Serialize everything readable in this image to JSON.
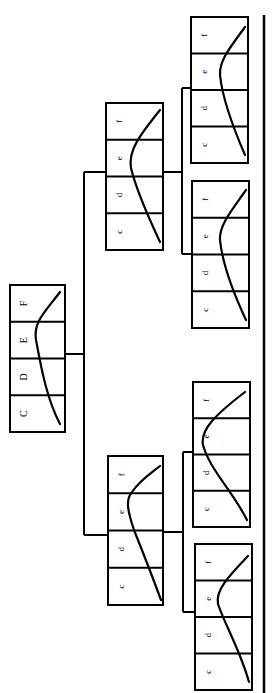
{
  "diagram": {
    "orientation": "rotated-90-ccw",
    "root": {
      "labels": [
        "C",
        "D",
        "E",
        "F"
      ],
      "box": {
        "x": 10,
        "y": 285,
        "w": 55,
        "h": 147
      },
      "curve": "M 60 424 C 45 395, 40 360, 36 340 C 33 322, 45 312, 60 292"
    },
    "level1": [
      {
        "id": "mid-top",
        "labels": [
          "c",
          "d",
          "e",
          "f"
        ],
        "box": {
          "x": 106,
          "y": 103,
          "w": 57,
          "h": 147
        },
        "curve": "M 160 242 C 145 210, 135 185, 131 168 C 128 150, 140 135, 160 110"
      },
      {
        "id": "mid-bottom",
        "labels": [
          "c",
          "d",
          "e",
          "f"
        ],
        "box": {
          "x": 108,
          "y": 456,
          "w": 55,
          "h": 149
        },
        "curve": "M 161 600 C 150 570, 140 545, 134 530 C 128 512, 125 500, 132 492 C 140 480, 150 474, 160 466"
      }
    ],
    "leaves": [
      {
        "id": "leaf-1",
        "labels": [
          "c",
          "d",
          "e",
          "f"
        ],
        "box": {
          "x": 191,
          "y": 17,
          "w": 57,
          "h": 146
        },
        "curve": "M 245 155 C 232 125, 222 95, 220 75 C 219 60, 232 45, 245 27"
      },
      {
        "id": "leaf-2",
        "labels": [
          "c",
          "d",
          "e",
          "f"
        ],
        "box": {
          "x": 192,
          "y": 181,
          "w": 57,
          "h": 147
        },
        "curve": "M 246 320 C 232 290, 222 260, 220 240 C 219 225, 232 210, 246 190"
      },
      {
        "id": "leaf-3",
        "labels": [
          "c",
          "d",
          "e",
          "f"
        ],
        "box": {
          "x": 193,
          "y": 382,
          "w": 57,
          "h": 145
        },
        "curve": "M 247 520 C 232 490, 210 470, 203 445 C 200 430, 215 415, 245 392"
      },
      {
        "id": "leaf-4",
        "labels": [
          "c",
          "d",
          "e",
          "f"
        ],
        "box": {
          "x": 195,
          "y": 544,
          "w": 57,
          "h": 146
        },
        "curve": "M 249 682 C 240 650, 225 625, 218 604 C 215 590, 230 575, 248 556"
      }
    ],
    "connectors": [
      {
        "id": "root-stub",
        "points": "65,354 84,354"
      },
      {
        "id": "root-trunk",
        "points": "84,172 84,535"
      },
      {
        "id": "root-to-top",
        "points": "84,172 106,172"
      },
      {
        "id": "root-to-bottom",
        "points": "84,535 108,535"
      },
      {
        "id": "top-stub",
        "points": "163,172 182,172"
      },
      {
        "id": "top-trunk",
        "points": "182,88 182,254"
      },
      {
        "id": "top-to-leaf1",
        "points": "182,88 191,88"
      },
      {
        "id": "top-to-leaf2",
        "points": "182,254 192,254"
      },
      {
        "id": "bottom-stub",
        "points": "163,532 183,532"
      },
      {
        "id": "bottom-trunk",
        "points": "183,452 183,612"
      },
      {
        "id": "bottom-to-leaf3",
        "points": "183,452 193,452"
      },
      {
        "id": "bottom-to-leaf4",
        "points": "183,612 195,612"
      }
    ],
    "baseline": {
      "x": 264,
      "y1": 15,
      "y2": 693
    }
  }
}
